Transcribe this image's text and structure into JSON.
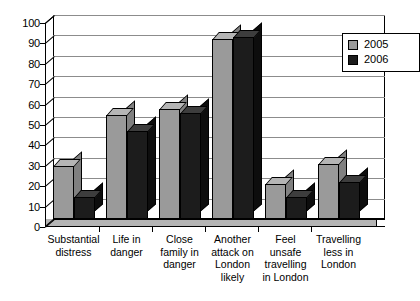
{
  "chart_data": {
    "type": "bar",
    "title": "",
    "subtitle": "",
    "xlabel": "",
    "ylabel": "",
    "ylim": [
      0,
      100
    ],
    "ytick_step": 10,
    "ytick_labels": [
      "100",
      "90",
      "80",
      "70",
      "60",
      "50",
      "40",
      "30",
      "20",
      "10",
      "0"
    ],
    "grid": "horizontal",
    "legend_position": "top-right",
    "style": "3d-clustered-column",
    "categories": [
      "Substantial\ndistress",
      "Life in\ndanger",
      "Close\nfamily in\ndanger",
      "Another\nattack on\nLondon\nlikely",
      "Feel\nunsafe\ntravelling\nin London",
      "Travelling\nless in\nLondon"
    ],
    "series": [
      {
        "name": "2005",
        "color": "#9a9a9a",
        "values": [
          26,
          51,
          54,
          88,
          17,
          27
        ]
      },
      {
        "name": "2006",
        "color": "#1c1c1c",
        "values": [
          11,
          43,
          52,
          89,
          11,
          18
        ]
      }
    ]
  },
  "legend": {
    "entries": [
      {
        "label": "2005",
        "swatch": "legend-swatch-2005"
      },
      {
        "label": "2006",
        "swatch": "legend-swatch-2006"
      }
    ]
  },
  "colors": {
    "series_2005": "#9a9a9a",
    "series_2006": "#1c1c1c",
    "gridline": "#8c8c8c",
    "axis": "#000000",
    "plot_background": "#ffffff",
    "floor": "#b4b4b4"
  }
}
